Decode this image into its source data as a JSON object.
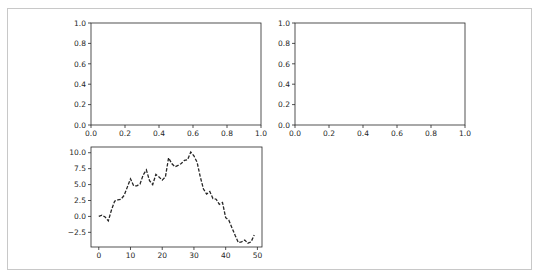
{
  "figure": {
    "border_color": "#c8c8c8",
    "axes_color": "#262626",
    "line_color": "#262626"
  },
  "chart_data": [
    {
      "type": "line",
      "position": "top-left",
      "title": "",
      "xlabel": "",
      "ylabel": "",
      "xlim": [
        0.0,
        1.0
      ],
      "ylim": [
        0.0,
        1.0
      ],
      "x_ticks": [
        "0.0",
        "0.2",
        "0.4",
        "0.6",
        "0.8",
        "1.0"
      ],
      "y_ticks": [
        "0.0",
        "0.2",
        "0.4",
        "0.6",
        "0.8",
        "1.0"
      ],
      "grid": false,
      "series": []
    },
    {
      "type": "line",
      "position": "top-right",
      "title": "",
      "xlabel": "",
      "ylabel": "",
      "xlim": [
        0.0,
        1.0
      ],
      "ylim": [
        0.0,
        1.0
      ],
      "x_ticks": [
        "0.0",
        "0.2",
        "0.4",
        "0.6",
        "0.8",
        "1.0"
      ],
      "y_ticks": [
        "0.0",
        "0.2",
        "0.4",
        "0.6",
        "0.8",
        "1.0"
      ],
      "grid": false,
      "series": []
    },
    {
      "type": "line",
      "position": "bottom-left",
      "title": "",
      "xlabel": "",
      "ylabel": "",
      "xlim": [
        -2.45,
        51.45
      ],
      "ylim": [
        -4.8,
        10.9
      ],
      "x_ticks": [
        "0",
        "10",
        "20",
        "30",
        "40",
        "50"
      ],
      "x_tick_values": [
        0,
        10,
        20,
        30,
        40,
        50
      ],
      "y_ticks": [
        "10.0",
        "7.5",
        "5.0",
        "2.5",
        "0.0",
        "−2.5"
      ],
      "y_tick_values": [
        10.0,
        7.5,
        5.0,
        2.5,
        0.0,
        -2.5
      ],
      "grid": false,
      "legend": null,
      "series": [
        {
          "name": "random walk",
          "style": "dashed",
          "color": "#262626",
          "x": [
            0,
            1,
            2,
            3,
            4,
            5,
            6,
            7,
            8,
            9,
            10,
            11,
            12,
            13,
            14,
            15,
            16,
            17,
            18,
            19,
            20,
            21,
            22,
            23,
            24,
            25,
            26,
            27,
            28,
            29,
            30,
            31,
            32,
            33,
            34,
            35,
            36,
            37,
            38,
            39,
            40,
            41,
            42,
            43,
            44,
            45,
            46,
            47,
            48,
            49
          ],
          "values": [
            0.0,
            0.2,
            -0.1,
            -0.7,
            1.0,
            2.4,
            2.6,
            2.7,
            3.3,
            4.6,
            5.9,
            4.8,
            4.8,
            5.1,
            6.5,
            7.3,
            5.6,
            5.0,
            6.6,
            6.2,
            5.7,
            6.2,
            9.2,
            8.3,
            7.8,
            8.0,
            8.3,
            8.8,
            8.9,
            10.1,
            9.5,
            8.5,
            6.2,
            4.3,
            3.5,
            3.9,
            2.8,
            2.7,
            1.9,
            2.2,
            -0.2,
            -0.6,
            -1.8,
            -3.0,
            -4.1,
            -4.0,
            -3.7,
            -4.2,
            -4.0,
            -2.9
          ]
        }
      ]
    }
  ]
}
